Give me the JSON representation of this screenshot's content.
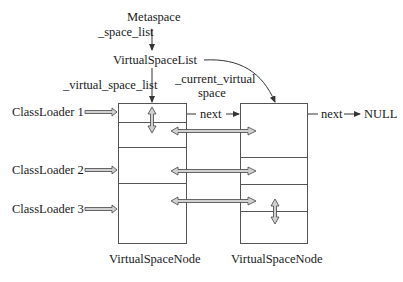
{
  "diagram": {
    "top_labels": {
      "metaspace": "Metaspace",
      "space_list": "_space_list",
      "virtual_space_list_class": "VirtualSpaceList",
      "virtual_space_list_field": "_virtual_space_list",
      "current_virtual_line1": "_current_virtual",
      "current_virtual_line2": "space"
    },
    "class_loaders": [
      "ClassLoader 1",
      "ClassLoader 2",
      "ClassLoader 3"
    ],
    "links": {
      "next_between": "next",
      "next_right": "next",
      "null": "NULL"
    },
    "nodes": [
      {
        "caption": "VirtualSpaceNode"
      },
      {
        "caption": "VirtualSpaceNode"
      }
    ],
    "colors": {
      "line": "#333333",
      "arrow_fill": "#d0d0d0",
      "background": "#ffffff"
    }
  }
}
